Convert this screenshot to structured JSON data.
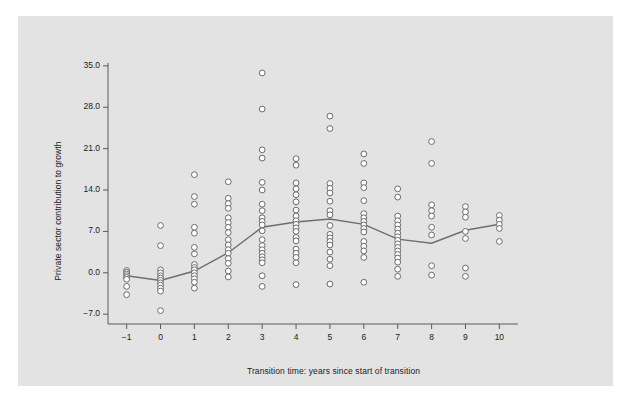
{
  "figure": {
    "background_color": "#ffffff",
    "panel_color": "#e3e3e3",
    "point_color": "#ffffff",
    "point_edge_color": "#6b6b6b",
    "line_color": "#6e6e6e",
    "axis_color": "#5a5a5a",
    "text_color": "#1c1c1c"
  },
  "chart_data": {
    "type": "scatter",
    "title": "",
    "xlabel": "Transition time: years since start of transition",
    "ylabel": "Private sector contribution to growth",
    "xlim": [
      -1.55,
      10.55
    ],
    "ylim": [
      -9.0,
      36.5
    ],
    "grid": false,
    "legend": null,
    "xticks": [
      -1,
      0,
      1,
      2,
      3,
      4,
      5,
      6,
      7,
      8,
      9,
      10
    ],
    "xtick_labels": [
      "−1",
      "0",
      "1",
      "2",
      "3",
      "4",
      "5",
      "6",
      "7",
      "8",
      "9",
      "10"
    ],
    "yticks": [
      -7.0,
      0.0,
      7.0,
      14.0,
      21.0,
      28.0,
      35.0
    ],
    "ytick_labels": [
      "−7.0",
      "0.0",
      "7.0",
      "14.0",
      "21.0",
      "28.0",
      "35.0"
    ],
    "marker": "open-circle",
    "series": [
      {
        "name": "observations",
        "type": "scatter",
        "points": [
          {
            "x": -1,
            "y": 0.4
          },
          {
            "x": -1,
            "y": 0.1
          },
          {
            "x": -1,
            "y": -0.2
          },
          {
            "x": -1,
            "y": -0.5
          },
          {
            "x": -1,
            "y": -0.8
          },
          {
            "x": -1,
            "y": -1.1
          },
          {
            "x": -1,
            "y": -2.3
          },
          {
            "x": -1,
            "y": -3.7
          },
          {
            "x": 0,
            "y": 8.0
          },
          {
            "x": 0,
            "y": 4.6
          },
          {
            "x": 0,
            "y": 0.5
          },
          {
            "x": 0,
            "y": 0.0
          },
          {
            "x": 0,
            "y": -0.5
          },
          {
            "x": 0,
            "y": -0.9
          },
          {
            "x": 0,
            "y": -1.3
          },
          {
            "x": 0,
            "y": -1.7
          },
          {
            "x": 0,
            "y": -2.1
          },
          {
            "x": 0,
            "y": -2.6
          },
          {
            "x": 0,
            "y": -3.1
          },
          {
            "x": 0,
            "y": -6.4
          },
          {
            "x": 1,
            "y": 16.6
          },
          {
            "x": 1,
            "y": 12.9
          },
          {
            "x": 1,
            "y": 11.6
          },
          {
            "x": 1,
            "y": 7.7
          },
          {
            "x": 1,
            "y": 6.7
          },
          {
            "x": 1,
            "y": 4.3
          },
          {
            "x": 1,
            "y": 3.2
          },
          {
            "x": 1,
            "y": 1.4
          },
          {
            "x": 1,
            "y": 0.9
          },
          {
            "x": 1,
            "y": 0.5
          },
          {
            "x": 1,
            "y": 0.0
          },
          {
            "x": 1,
            "y": -0.5
          },
          {
            "x": 1,
            "y": -1.0
          },
          {
            "x": 1,
            "y": -1.6
          },
          {
            "x": 1,
            "y": -2.6
          },
          {
            "x": 2,
            "y": 15.4
          },
          {
            "x": 2,
            "y": 12.6
          },
          {
            "x": 2,
            "y": 11.7
          },
          {
            "x": 2,
            "y": 10.9
          },
          {
            "x": 2,
            "y": 9.3
          },
          {
            "x": 2,
            "y": 8.5
          },
          {
            "x": 2,
            "y": 7.7
          },
          {
            "x": 2,
            "y": 6.8
          },
          {
            "x": 2,
            "y": 5.6
          },
          {
            "x": 2,
            "y": 4.7
          },
          {
            "x": 2,
            "y": 3.9
          },
          {
            "x": 2,
            "y": 3.3
          },
          {
            "x": 2,
            "y": 2.4
          },
          {
            "x": 2,
            "y": 1.6
          },
          {
            "x": 2,
            "y": 0.3
          },
          {
            "x": 2,
            "y": -0.7
          },
          {
            "x": 3,
            "y": 33.8
          },
          {
            "x": 3,
            "y": 27.7
          },
          {
            "x": 3,
            "y": 20.8
          },
          {
            "x": 3,
            "y": 19.4
          },
          {
            "x": 3,
            "y": 15.3
          },
          {
            "x": 3,
            "y": 14.0
          },
          {
            "x": 3,
            "y": 11.6
          },
          {
            "x": 3,
            "y": 10.5
          },
          {
            "x": 3,
            "y": 9.3
          },
          {
            "x": 3,
            "y": 8.7
          },
          {
            "x": 3,
            "y": 8.1
          },
          {
            "x": 3,
            "y": 7.1
          },
          {
            "x": 3,
            "y": 5.6
          },
          {
            "x": 3,
            "y": 4.6
          },
          {
            "x": 3,
            "y": 3.9
          },
          {
            "x": 3,
            "y": 3.3
          },
          {
            "x": 3,
            "y": 2.7
          },
          {
            "x": 3,
            "y": 2.2
          },
          {
            "x": 3,
            "y": 1.7
          },
          {
            "x": 3,
            "y": -0.5
          },
          {
            "x": 3,
            "y": -2.3
          },
          {
            "x": 4,
            "y": 19.3
          },
          {
            "x": 4,
            "y": 18.2
          },
          {
            "x": 4,
            "y": 15.2
          },
          {
            "x": 4,
            "y": 14.2
          },
          {
            "x": 4,
            "y": 13.2
          },
          {
            "x": 4,
            "y": 12.0
          },
          {
            "x": 4,
            "y": 10.6
          },
          {
            "x": 4,
            "y": 9.6
          },
          {
            "x": 4,
            "y": 8.8
          },
          {
            "x": 4,
            "y": 8.2
          },
          {
            "x": 4,
            "y": 7.6
          },
          {
            "x": 4,
            "y": 7.0
          },
          {
            "x": 4,
            "y": 6.0
          },
          {
            "x": 4,
            "y": 5.4
          },
          {
            "x": 4,
            "y": 4.0
          },
          {
            "x": 4,
            "y": 3.3
          },
          {
            "x": 4,
            "y": 2.6
          },
          {
            "x": 4,
            "y": 1.7
          },
          {
            "x": 4,
            "y": -2.0
          },
          {
            "x": 5,
            "y": 26.5
          },
          {
            "x": 5,
            "y": 24.4
          },
          {
            "x": 5,
            "y": 15.1
          },
          {
            "x": 5,
            "y": 14.3
          },
          {
            "x": 5,
            "y": 13.5
          },
          {
            "x": 5,
            "y": 12.1
          },
          {
            "x": 5,
            "y": 10.5
          },
          {
            "x": 5,
            "y": 9.8
          },
          {
            "x": 5,
            "y": 8.0
          },
          {
            "x": 5,
            "y": 6.5
          },
          {
            "x": 5,
            "y": 5.9
          },
          {
            "x": 5,
            "y": 5.3
          },
          {
            "x": 5,
            "y": 4.7
          },
          {
            "x": 5,
            "y": 3.5
          },
          {
            "x": 5,
            "y": 2.3
          },
          {
            "x": 5,
            "y": 1.2
          },
          {
            "x": 5,
            "y": -1.9
          },
          {
            "x": 6,
            "y": 20.1
          },
          {
            "x": 6,
            "y": 18.5
          },
          {
            "x": 6,
            "y": 15.2
          },
          {
            "x": 6,
            "y": 14.4
          },
          {
            "x": 6,
            "y": 12.2
          },
          {
            "x": 6,
            "y": 10.0
          },
          {
            "x": 6,
            "y": 9.3
          },
          {
            "x": 6,
            "y": 8.7
          },
          {
            "x": 6,
            "y": 8.1
          },
          {
            "x": 6,
            "y": 7.5
          },
          {
            "x": 6,
            "y": 6.9
          },
          {
            "x": 6,
            "y": 5.3
          },
          {
            "x": 6,
            "y": 4.5
          },
          {
            "x": 6,
            "y": 3.7
          },
          {
            "x": 6,
            "y": 2.6
          },
          {
            "x": 6,
            "y": -1.6
          },
          {
            "x": 7,
            "y": 14.2
          },
          {
            "x": 7,
            "y": 12.8
          },
          {
            "x": 7,
            "y": 9.6
          },
          {
            "x": 7,
            "y": 8.8
          },
          {
            "x": 7,
            "y": 8.1
          },
          {
            "x": 7,
            "y": 7.4
          },
          {
            "x": 7,
            "y": 6.7
          },
          {
            "x": 7,
            "y": 6.1
          },
          {
            "x": 7,
            "y": 5.5
          },
          {
            "x": 7,
            "y": 4.9
          },
          {
            "x": 7,
            "y": 4.3
          },
          {
            "x": 7,
            "y": 3.7
          },
          {
            "x": 7,
            "y": 3.1
          },
          {
            "x": 7,
            "y": 2.5
          },
          {
            "x": 7,
            "y": 1.8
          },
          {
            "x": 7,
            "y": 0.6
          },
          {
            "x": 7,
            "y": -0.6
          },
          {
            "x": 8,
            "y": 22.2
          },
          {
            "x": 8,
            "y": 18.5
          },
          {
            "x": 8,
            "y": 11.5
          },
          {
            "x": 8,
            "y": 10.5
          },
          {
            "x": 8,
            "y": 9.6
          },
          {
            "x": 8,
            "y": 7.7
          },
          {
            "x": 8,
            "y": 6.4
          },
          {
            "x": 8,
            "y": 1.2
          },
          {
            "x": 8,
            "y": -0.4
          },
          {
            "x": 9,
            "y": 11.2
          },
          {
            "x": 9,
            "y": 10.3
          },
          {
            "x": 9,
            "y": 9.4
          },
          {
            "x": 9,
            "y": 7.0
          },
          {
            "x": 9,
            "y": 5.8
          },
          {
            "x": 9,
            "y": 0.8
          },
          {
            "x": 9,
            "y": -0.6
          },
          {
            "x": 10,
            "y": 9.7
          },
          {
            "x": 10,
            "y": 8.9
          },
          {
            "x": 10,
            "y": 8.2
          },
          {
            "x": 10,
            "y": 7.5
          },
          {
            "x": 10,
            "y": 5.3
          }
        ]
      },
      {
        "name": "mean-trend-line",
        "type": "line",
        "x": [
          -1,
          0,
          1,
          2,
          3,
          4,
          5,
          6,
          7,
          8,
          9,
          10
        ],
        "values": [
          -0.5,
          -1.3,
          0.3,
          3.4,
          7.7,
          8.6,
          9.1,
          8.2,
          5.7,
          5.0,
          7.2,
          8.2
        ]
      }
    ]
  }
}
